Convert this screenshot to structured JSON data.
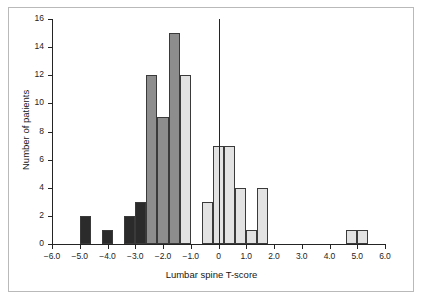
{
  "chart_data": {
    "type": "bar",
    "title": "",
    "xlabel": "Lumbar spine T-score",
    "ylabel": "Number of patients",
    "xlim": [
      -6.0,
      6.0
    ],
    "ylim": [
      0,
      16
    ],
    "xticks": [
      "-6.0",
      "-5.0",
      "-4.0",
      "-3.0",
      "-2.0",
      "-1.0",
      "0",
      "1.0",
      "2.0",
      "3.0",
      "4.0",
      "5.0",
      "6.0"
    ],
    "xtick_values": [
      -6.0,
      -5.0,
      -4.0,
      -3.0,
      -2.0,
      -1.0,
      0,
      1.0,
      2.0,
      3.0,
      4.0,
      5.0,
      6.0
    ],
    "yticks": [
      "0",
      "2",
      "4",
      "6",
      "8",
      "10",
      "12",
      "14",
      "16"
    ],
    "ytick_values": [
      0,
      2,
      4,
      6,
      8,
      10,
      12,
      14,
      16
    ],
    "grid": false,
    "legend": "none",
    "bin_width": 0.4,
    "annotations": [
      {
        "name": "zero-reference-line",
        "x": 0,
        "y_from": 0,
        "y_to": 16
      }
    ],
    "colors": {
      "osteoporotic_dark": "#2b2b2b",
      "osteopenic_medium": "#8d8d8d",
      "normal_light": "#e2e2e2",
      "bar_outline": "#3a3a3a",
      "axis": "#242424",
      "frame": "#b9b9b9"
    },
    "bins": [
      {
        "x_left": -5.0,
        "x_right": -4.6,
        "value": 2,
        "group": "osteoporotic_dark"
      },
      {
        "x_left": -4.2,
        "x_right": -3.8,
        "value": 1,
        "group": "osteoporotic_dark"
      },
      {
        "x_left": -3.8,
        "x_right": -3.4,
        "value": 0,
        "group": "osteoporotic_dark"
      },
      {
        "x_left": -3.4,
        "x_right": -3.0,
        "value": 2,
        "group": "osteoporotic_dark"
      },
      {
        "x_left": -3.0,
        "x_right": -2.6,
        "value": 3,
        "group": "osteoporotic_dark"
      },
      {
        "x_left": -2.6,
        "x_right": -2.2,
        "value": 12,
        "group": "osteopenic_medium"
      },
      {
        "x_left": -2.2,
        "x_right": -1.8,
        "value": 9,
        "group": "osteopenic_medium"
      },
      {
        "x_left": -1.8,
        "x_right": -1.4,
        "value": 15,
        "group": "osteopenic_medium"
      },
      {
        "x_left": -1.4,
        "x_right": -1.0,
        "value": 12,
        "group": "normal_light"
      },
      {
        "x_left": -0.6,
        "x_right": -0.2,
        "value": 3,
        "group": "normal_light"
      },
      {
        "x_left": -0.2,
        "x_right": 0.2,
        "value": 7,
        "group": "normal_light"
      },
      {
        "x_left": 0.2,
        "x_right": 0.6,
        "value": 7,
        "group": "normal_light"
      },
      {
        "x_left": 0.6,
        "x_right": 1.0,
        "value": 4,
        "group": "normal_light"
      },
      {
        "x_left": 1.0,
        "x_right": 1.4,
        "value": 1,
        "group": "normal_light"
      },
      {
        "x_left": 1.4,
        "x_right": 1.8,
        "value": 4,
        "group": "normal_light"
      },
      {
        "x_left": 4.6,
        "x_right": 5.0,
        "value": 1,
        "group": "normal_light"
      },
      {
        "x_left": 5.0,
        "x_right": 5.4,
        "value": 1,
        "group": "normal_light"
      }
    ]
  }
}
